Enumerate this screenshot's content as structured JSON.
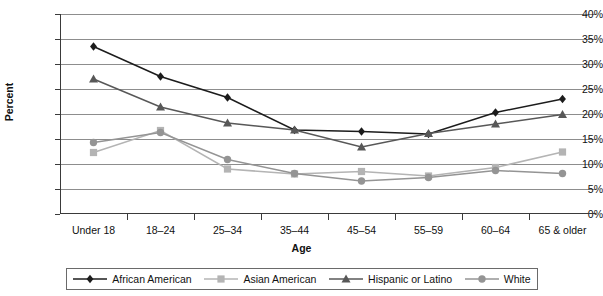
{
  "chart_data": {
    "type": "line",
    "title": "",
    "xlabel": "Age",
    "ylabel": "Percent",
    "ylim": [
      0,
      40
    ],
    "ytick_step": 5,
    "ytick_labels": [
      "0%",
      "5%",
      "10%",
      "15%",
      "20%",
      "25%",
      "30%",
      "35%",
      "40%"
    ],
    "grid": true,
    "legend_position": "bottom",
    "categories": [
      "Under 18",
      "18–24",
      "25–34",
      "35–44",
      "45–54",
      "55–59",
      "60–64",
      "65 & older"
    ],
    "series": [
      {
        "name": "African American",
        "marker": "diamond",
        "color": "#1c1c1c",
        "values": [
          33.5,
          27.5,
          23.3,
          16.8,
          16.5,
          16.0,
          20.3,
          23.0
        ]
      },
      {
        "name": "Asian American",
        "marker": "square",
        "color": "#b4b4b4",
        "values": [
          12.3,
          16.7,
          9.0,
          8.0,
          8.5,
          7.6,
          9.3,
          12.4
        ]
      },
      {
        "name": "Hispanic or Latino",
        "marker": "triangle",
        "color": "#585858",
        "values": [
          27.0,
          21.4,
          18.2,
          16.8,
          13.4,
          16.1,
          18.0,
          19.9
        ]
      },
      {
        "name": "White",
        "marker": "circle",
        "color": "#949494",
        "values": [
          14.3,
          16.3,
          10.9,
          8.1,
          6.6,
          7.3,
          8.7,
          8.1
        ]
      }
    ]
  }
}
